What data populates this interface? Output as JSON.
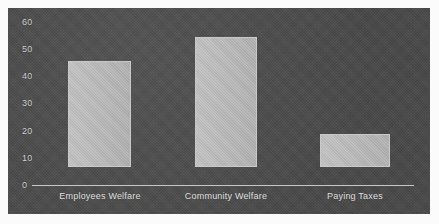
{
  "chart_data": {
    "type": "bar",
    "title": "",
    "subtitle": "",
    "xlabel": "",
    "ylabel": "",
    "categories": [
      "Employees Welfare",
      "Community Welfare",
      "Paying Taxes"
    ],
    "values": [
      39,
      48,
      12
    ],
    "series": [
      {
        "name": "",
        "values": [
          39,
          48,
          12
        ]
      }
    ],
    "ylim": [
      0,
      60
    ],
    "y_ticks": [
      0,
      10,
      20,
      30,
      40,
      50,
      60
    ],
    "y_tick_labels": [
      "0",
      "10",
      "20",
      "30",
      "40",
      "50",
      "60"
    ],
    "grid": false,
    "legend": false,
    "legend_position": "none",
    "annotations": [],
    "colors": {
      "plot_background": "#4b4b4b",
      "figure_background": "#fbfbfb",
      "bar_fill": "#b9b9b9",
      "axis_line": "#dcdcdc",
      "tick_text": "#d2d2d2",
      "category_text": "#e3e3e3"
    }
  },
  "axis": {
    "y_labels": [
      {
        "text": "60",
        "value": 60
      },
      {
        "text": "50",
        "value": 50
      },
      {
        "text": "40",
        "value": 40
      },
      {
        "text": "30",
        "value": 30
      },
      {
        "text": "20",
        "value": 20
      },
      {
        "text": "10",
        "value": 10
      },
      {
        "text": "0",
        "value": 0
      }
    ]
  },
  "bars": [
    {
      "label": "Employees Welfare",
      "value": 39
    },
    {
      "label": "Community Welfare",
      "value": 48
    },
    {
      "label": "Paying Taxes",
      "value": 12
    }
  ]
}
